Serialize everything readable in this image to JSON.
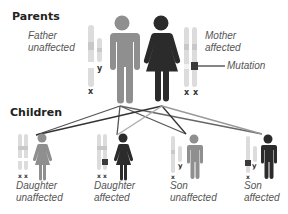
{
  "colors": {
    "unaffected": "#8f8f8f",
    "affected": "#2b2b2b",
    "chromosome": "#dcdcdc",
    "chromosome_band": "#c8c8c8",
    "mutation": "#3a3a3a"
  },
  "parents": {
    "heading": "Parents",
    "father": {
      "label_line1": "Father",
      "label_line2": "unaffected",
      "chromosomes": [
        "x",
        "y"
      ],
      "status": "unaffected"
    },
    "mother": {
      "label_line1": "Mother",
      "label_line2": "affected",
      "chromosomes": [
        "x",
        "x"
      ],
      "status": "affected"
    },
    "mutation_label": "Mutation"
  },
  "children": {
    "heading": "Children",
    "items": [
      {
        "label_line1": "Daughter",
        "label_line2": "unaffected",
        "chromosomes": [
          "x",
          "x"
        ],
        "status": "unaffected",
        "sex": "female"
      },
      {
        "label_line1": "Daughter",
        "label_line2": "affected",
        "chromosomes": [
          "x",
          "x"
        ],
        "status": "affected",
        "sex": "female"
      },
      {
        "label_line1": "Son",
        "label_line2": "unaffected",
        "chromosomes": [
          "x",
          "y"
        ],
        "status": "unaffected",
        "sex": "male"
      },
      {
        "label_line1": "Son",
        "label_line2": "affected",
        "chromosomes": [
          "x",
          "y"
        ],
        "status": "affected",
        "sex": "male"
      }
    ]
  },
  "chr_labels": {
    "x": "x",
    "y": "y"
  }
}
